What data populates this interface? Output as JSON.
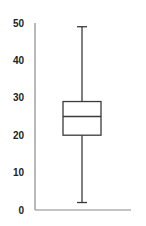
{
  "chart_data": {
    "type": "boxplot",
    "title": "",
    "xlabel": "",
    "ylabel": "",
    "ylim": [
      0,
      50
    ],
    "yticks": [
      0,
      10,
      20,
      30,
      40,
      50
    ],
    "ytick_labels": [
      "0",
      "10",
      "20",
      "30",
      "40",
      "50"
    ],
    "grid": false,
    "legend": null,
    "series": [
      {
        "name": "",
        "whisker_low": 2,
        "q1": 20,
        "median": 25,
        "q3": 29,
        "whisker_high": 49
      }
    ],
    "colors": {
      "axis": "#8a8a8a",
      "box": "#3a3a3a",
      "text": "#222222"
    }
  }
}
